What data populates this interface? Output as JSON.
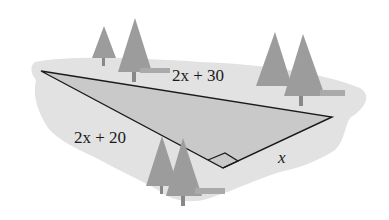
{
  "diagram": {
    "type": "right-triangle-word-problem",
    "sides": {
      "hypotenuse": "2x + 30",
      "long_leg": "2x + 20",
      "short_leg": "x"
    },
    "right_angle_marker": true,
    "colors": {
      "land": "#e2e2e2",
      "triangle_fill": "#c9c9c9",
      "trees": "#9a9a9a",
      "lines": "#1a1a1a"
    }
  }
}
